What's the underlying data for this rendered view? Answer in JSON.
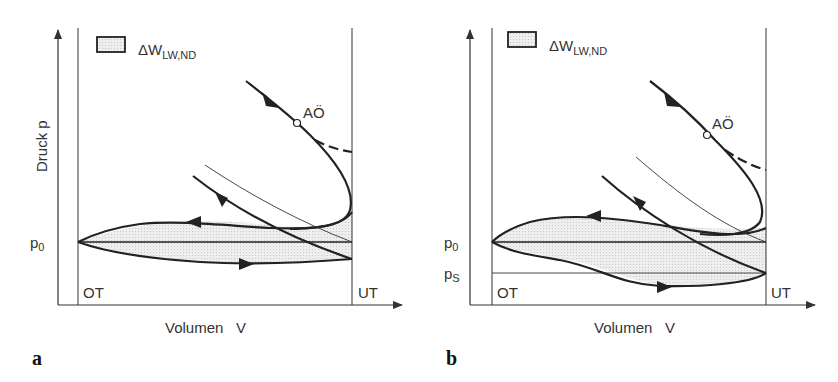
{
  "figure": {
    "panels": [
      {
        "id": "a",
        "letter": "a",
        "y_label": "Druck  p",
        "x_label": "Volumen   V",
        "legend_label": "ΔW",
        "legend_sub": "LW,ND",
        "tdc_label": "OT",
        "bdc_label": "UT",
        "point_label": "AÖ",
        "p0_label": "p",
        "p0_sub": "0"
      },
      {
        "id": "b",
        "letter": "b",
        "x_label": "Volumen   V",
        "legend_label": "ΔW",
        "legend_sub": "LW,ND",
        "tdc_label": "OT",
        "bdc_label": "UT",
        "point_label": "AÖ",
        "p0_label": "p",
        "p0_sub": "0",
        "ps_label": "p",
        "ps_sub": "S"
      }
    ],
    "colors": {
      "line": "#222222",
      "fill": "#e6e6e6",
      "axis": "#333333"
    }
  }
}
